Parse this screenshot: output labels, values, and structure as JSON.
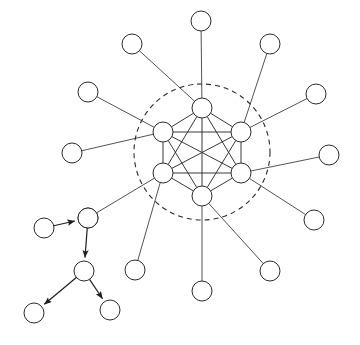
{
  "figure": {
    "background_color": "#ffffff",
    "width": 360,
    "height": 345
  },
  "style": {
    "node_fill": "#ffffff",
    "node_stroke": "#2b2b2b",
    "node_radius": 10,
    "edge_color": "#3a3a3a",
    "core_edge_color": "#2e2e2e",
    "tree_edge_color": "#1d1d1d",
    "boundary_stroke": "#2b2b2b",
    "boundary_dash": "5 4"
  },
  "boundary": {
    "label": "cluster-boundary",
    "shape": "dashed-circle",
    "cx": 202,
    "cy": 152,
    "r": 68
  },
  "chart_data": {
    "type": "graph",
    "node_count": 23,
    "edge_count": 33,
    "directed_edges": 4,
    "groups": [
      {
        "name": "core",
        "label": "core cluster",
        "node_count": 6,
        "topology": "complete-graph-K6",
        "directed": false
      },
      {
        "name": "periphery",
        "label": "peripheral leaf nodes",
        "node_count": 12,
        "topology": "star-spokes",
        "directed": false
      },
      {
        "name": "branch",
        "label": "directed tree branch",
        "node_count": 5,
        "topology": "directed-tree",
        "directed": true
      }
    ],
    "nodes": [
      {
        "id": "c1",
        "group": "core",
        "x": 202,
        "y": 108
      },
      {
        "id": "c2",
        "group": "core",
        "x": 241,
        "y": 132
      },
      {
        "id": "c3",
        "group": "core",
        "x": 241,
        "y": 173
      },
      {
        "id": "c4",
        "group": "core",
        "x": 202,
        "y": 196
      },
      {
        "id": "c5",
        "group": "core",
        "x": 163,
        "y": 173
      },
      {
        "id": "c6",
        "group": "core",
        "x": 163,
        "y": 132
      },
      {
        "id": "p1",
        "group": "periphery",
        "x": 201,
        "y": 21
      },
      {
        "id": "p2",
        "group": "periphery",
        "x": 270,
        "y": 44
      },
      {
        "id": "p3",
        "group": "periphery",
        "x": 316,
        "y": 94
      },
      {
        "id": "p4",
        "group": "periphery",
        "x": 329,
        "y": 155
      },
      {
        "id": "p5",
        "group": "periphery",
        "x": 314,
        "y": 220
      },
      {
        "id": "p6",
        "group": "periphery",
        "x": 270,
        "y": 271
      },
      {
        "id": "p7",
        "group": "periphery",
        "x": 202,
        "y": 291
      },
      {
        "id": "p8",
        "group": "periphery",
        "x": 135,
        "y": 270
      },
      {
        "id": "p9",
        "group": "periphery",
        "x": 88,
        "y": 218
      },
      {
        "id": "p10",
        "group": "periphery",
        "x": 72,
        "y": 153
      },
      {
        "id": "p11",
        "group": "periphery",
        "x": 88,
        "y": 92
      },
      {
        "id": "p12",
        "group": "periphery",
        "x": 132,
        "y": 44
      },
      {
        "id": "b1",
        "group": "branch",
        "x": 44,
        "y": 228
      },
      {
        "id": "b2",
        "group": "branch",
        "x": 88,
        "y": 218
      },
      {
        "id": "b3",
        "group": "branch",
        "x": 84,
        "y": 271
      },
      {
        "id": "b4",
        "group": "branch",
        "x": 34,
        "y": 313
      },
      {
        "id": "b5",
        "group": "branch",
        "x": 110,
        "y": 310
      }
    ],
    "edges": [
      {
        "source": "c1",
        "target": "c2",
        "kind": "core"
      },
      {
        "source": "c1",
        "target": "c3",
        "kind": "core"
      },
      {
        "source": "c1",
        "target": "c4",
        "kind": "core"
      },
      {
        "source": "c1",
        "target": "c5",
        "kind": "core"
      },
      {
        "source": "c1",
        "target": "c6",
        "kind": "core"
      },
      {
        "source": "c2",
        "target": "c3",
        "kind": "core"
      },
      {
        "source": "c2",
        "target": "c4",
        "kind": "core"
      },
      {
        "source": "c2",
        "target": "c5",
        "kind": "core"
      },
      {
        "source": "c2",
        "target": "c6",
        "kind": "core"
      },
      {
        "source": "c3",
        "target": "c4",
        "kind": "core"
      },
      {
        "source": "c3",
        "target": "c5",
        "kind": "core"
      },
      {
        "source": "c3",
        "target": "c6",
        "kind": "core"
      },
      {
        "source": "c4",
        "target": "c5",
        "kind": "core"
      },
      {
        "source": "c4",
        "target": "c6",
        "kind": "core"
      },
      {
        "source": "c5",
        "target": "c6",
        "kind": "core"
      },
      {
        "source": "c1",
        "target": "p1",
        "kind": "spoke"
      },
      {
        "source": "c1",
        "target": "p12",
        "kind": "spoke"
      },
      {
        "source": "c2",
        "target": "p2",
        "kind": "spoke"
      },
      {
        "source": "c2",
        "target": "p3",
        "kind": "spoke"
      },
      {
        "source": "c3",
        "target": "p4",
        "kind": "spoke"
      },
      {
        "source": "c3",
        "target": "p5",
        "kind": "spoke"
      },
      {
        "source": "c4",
        "target": "p6",
        "kind": "spoke"
      },
      {
        "source": "c4",
        "target": "p7",
        "kind": "spoke"
      },
      {
        "source": "c5",
        "target": "p8",
        "kind": "spoke"
      },
      {
        "source": "c5",
        "target": "b2",
        "kind": "spoke"
      },
      {
        "source": "c6",
        "target": "p10",
        "kind": "spoke"
      },
      {
        "source": "c6",
        "target": "p11",
        "kind": "spoke"
      },
      {
        "source": "b1",
        "target": "b2",
        "kind": "branch",
        "directed": true
      },
      {
        "source": "b2",
        "target": "b3",
        "kind": "branch",
        "directed": true
      },
      {
        "source": "b3",
        "target": "b4",
        "kind": "branch",
        "directed": true
      },
      {
        "source": "b3",
        "target": "b5",
        "kind": "branch",
        "directed": true
      }
    ]
  }
}
